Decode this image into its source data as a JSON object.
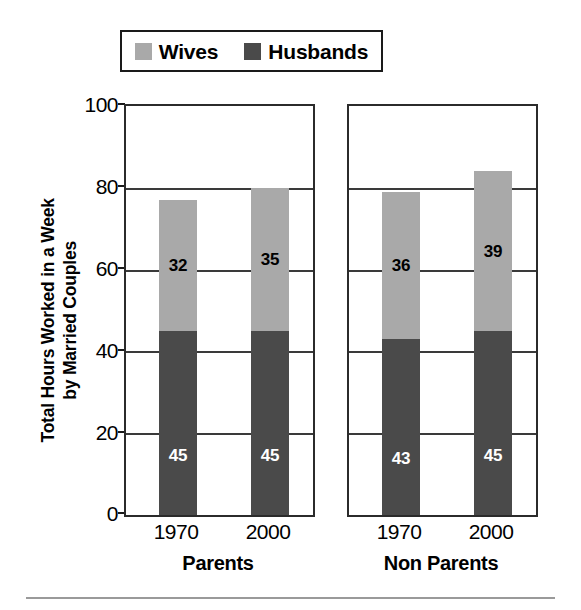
{
  "chart_data": {
    "type": "bar",
    "subtype": "stacked-bar-paneled",
    "title": "",
    "xlabel": "",
    "ylabel": "Total Hours Worked in a Week by Married Couples",
    "ylabel_lines": [
      "Total Hours Worked in a Week",
      "by Married Couples"
    ],
    "ylim": [
      0,
      100
    ],
    "yticks": [
      0,
      20,
      40,
      60,
      80,
      100
    ],
    "ytick_labels": [
      "0",
      "20",
      "40",
      "60",
      "80",
      "100"
    ],
    "grid": true,
    "grid_axis": "y",
    "legend_position": "top",
    "legend": [
      "Wives",
      "Husbands"
    ],
    "panels": [
      {
        "name": "Parents",
        "categories": [
          "1970",
          "2000"
        ],
        "series": [
          {
            "name": "Husbands",
            "values": [
              45,
              45
            ],
            "color": "#4a4a4a",
            "label_color": "#ffffff"
          },
          {
            "name": "Wives",
            "values": [
              32,
              35
            ],
            "color": "#a9a9a9",
            "label_color": "#000000"
          }
        ],
        "totals": [
          77,
          80
        ]
      },
      {
        "name": "Non Parents",
        "categories": [
          "1970",
          "2000"
        ],
        "series": [
          {
            "name": "Husbands",
            "values": [
              43,
              45
            ],
            "color": "#4a4a4a",
            "label_color": "#ffffff"
          },
          {
            "name": "Wives",
            "values": [
              36,
              39
            ],
            "color": "#a9a9a9",
            "label_color": "#000000"
          }
        ],
        "totals": [
          79,
          84
        ]
      }
    ]
  },
  "legend": {
    "items": [
      {
        "label": "Wives",
        "color": "#a9a9a9",
        "swatch_name": "wives-swatch"
      },
      {
        "label": "Husbands",
        "color": "#4a4a4a",
        "swatch_name": "husbands-swatch"
      }
    ]
  },
  "y_axis": {
    "title_line1": "Total Hours Worked in a Week",
    "title_line2": "by Married Couples",
    "ticks": [
      "100",
      "80",
      "60",
      "40",
      "20",
      "0"
    ]
  },
  "panels": {
    "parents": {
      "group_label": "Parents",
      "bars": [
        {
          "category": "1970",
          "husbands_value": "45",
          "wives_value": "32"
        },
        {
          "category": "2000",
          "husbands_value": "45",
          "wives_value": "35"
        }
      ]
    },
    "nonparents": {
      "group_label": "Non Parents",
      "bars": [
        {
          "category": "1970",
          "husbands_value": "43",
          "wives_value": "36"
        },
        {
          "category": "2000",
          "husbands_value": "45",
          "wives_value": "39"
        }
      ]
    }
  }
}
